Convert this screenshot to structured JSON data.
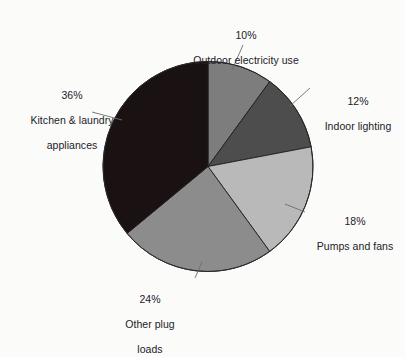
{
  "chart_data": {
    "type": "pie",
    "title": "",
    "subtitle": "",
    "xlabel": "",
    "ylabel": "",
    "legend_position": "none",
    "grid": false,
    "start_angle_deg": 0,
    "direction": "clockwise",
    "units": "percent",
    "categories": [
      "Outdoor electricity use",
      "Indoor lighting",
      "Pumps and fans",
      "Other plug loads",
      "Kitchen & laundry appliances"
    ],
    "values": [
      10,
      12,
      18,
      24,
      36
    ],
    "slices": [
      {
        "label": "Outdoor electricity use",
        "label_line1": "Outdoor electricity use",
        "label_line2": "",
        "percent_text": "10%",
        "value": 10,
        "color": "#7d7d7d"
      },
      {
        "label": "Indoor lighting",
        "label_line1": "Indoor lighting",
        "label_line2": "",
        "percent_text": "12%",
        "value": 12,
        "color": "#4d4d4d"
      },
      {
        "label": "Pumps and fans",
        "label_line1": "Pumps and fans",
        "label_line2": "",
        "percent_text": "18%",
        "value": 18,
        "color": "#b9b9b9"
      },
      {
        "label": "Other plug loads",
        "label_line1": "Other plug",
        "label_line2": "loads",
        "percent_text": "24%",
        "value": 24,
        "color": "#8c8c8c"
      },
      {
        "label": "Kitchen & laundry appliances",
        "label_line1": "Kitchen & laundry",
        "label_line2": "appliances",
        "percent_text": "36%",
        "value": 36,
        "color": "#1a1212"
      }
    ],
    "total": 100,
    "background_color": "#fbfbfa",
    "leader_line_color": "#6d6d6d",
    "text_color": "#22211f"
  }
}
